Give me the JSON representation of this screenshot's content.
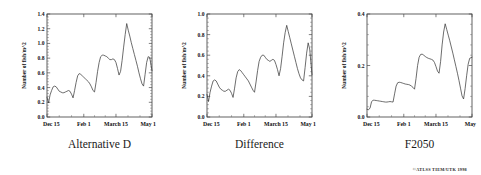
{
  "figure": {
    "credit": "©ATLSS TIEM/UTK 1998",
    "width": 481,
    "height": 175
  },
  "chart_data": [
    {
      "type": "line",
      "title": "Alternative D",
      "xlabel": "",
      "ylabel": "Number of fish/m^2",
      "ylim": [
        0.0,
        1.4
      ],
      "yticks": [
        0.0,
        0.2,
        0.4,
        0.6,
        0.8,
        1.0,
        1.2,
        1.4
      ],
      "ytick_labels": [
        "0.0",
        "0.2",
        "0.4",
        "0.6",
        "0.8",
        "1.0",
        "1.2",
        "1.4"
      ],
      "xlim": [
        0,
        137
      ],
      "xticks": [
        0,
        48,
        90,
        137
      ],
      "xtick_labels": [
        "Dec 15",
        "Feb 1",
        "March 15",
        "May 1"
      ],
      "grid": false,
      "legend": "none",
      "x": [
        0,
        2,
        4,
        6,
        8,
        10,
        12,
        14,
        16,
        18,
        20,
        22,
        24,
        26,
        28,
        30,
        32,
        34,
        36,
        38,
        40,
        42,
        44,
        46,
        48,
        50,
        52,
        54,
        56,
        58,
        60,
        62,
        64,
        66,
        68,
        70,
        72,
        74,
        76,
        78,
        80,
        82,
        84,
        86,
        88,
        90,
        92,
        94,
        96,
        98,
        100,
        102,
        104,
        106,
        108,
        110,
        112,
        114,
        116,
        118,
        120,
        122,
        124,
        126,
        128,
        130,
        132,
        134,
        137
      ],
      "values": [
        0.27,
        0.19,
        0.3,
        0.36,
        0.41,
        0.42,
        0.41,
        0.38,
        0.35,
        0.34,
        0.33,
        0.33,
        0.34,
        0.35,
        0.36,
        0.35,
        0.31,
        0.26,
        0.36,
        0.47,
        0.56,
        0.59,
        0.58,
        0.56,
        0.54,
        0.52,
        0.5,
        0.48,
        0.45,
        0.41,
        0.36,
        0.34,
        0.47,
        0.62,
        0.74,
        0.82,
        0.84,
        0.84,
        0.83,
        0.82,
        0.8,
        0.78,
        0.78,
        0.79,
        0.78,
        0.74,
        0.66,
        0.57,
        0.62,
        0.77,
        0.95,
        1.12,
        1.27,
        1.18,
        1.1,
        1.01,
        0.93,
        0.85,
        0.77,
        0.69,
        0.6,
        0.52,
        0.45,
        0.42,
        0.58,
        0.74,
        0.82,
        0.81,
        0.63
      ]
    },
    {
      "type": "line",
      "title": "Difference",
      "xlabel": "",
      "ylabel": "Number of fish/m^2",
      "ylim": [
        0.0,
        1.0
      ],
      "yticks": [
        0.0,
        0.2,
        0.4,
        0.6,
        0.8,
        1.0
      ],
      "ytick_labels": [
        "0.0",
        "0.2",
        "0.4",
        "0.6",
        "0.8",
        "1.0"
      ],
      "xlim": [
        0,
        137
      ],
      "xticks": [
        0,
        48,
        90,
        137
      ],
      "xtick_labels": [
        "Dec 15",
        "Feb 1",
        "March 15",
        "May 1"
      ],
      "grid": false,
      "legend": "none",
      "x": [
        0,
        2,
        4,
        6,
        8,
        10,
        12,
        14,
        16,
        18,
        20,
        22,
        24,
        26,
        28,
        30,
        32,
        34,
        36,
        38,
        40,
        42,
        44,
        46,
        48,
        50,
        52,
        54,
        56,
        58,
        60,
        62,
        64,
        66,
        68,
        70,
        72,
        74,
        76,
        78,
        80,
        82,
        84,
        86,
        88,
        90,
        92,
        94,
        96,
        98,
        100,
        102,
        104,
        106,
        108,
        110,
        112,
        114,
        116,
        118,
        120,
        122,
        124,
        126,
        128,
        130,
        132,
        134,
        137
      ],
      "values": [
        0.22,
        0.15,
        0.24,
        0.3,
        0.35,
        0.36,
        0.35,
        0.32,
        0.29,
        0.27,
        0.26,
        0.25,
        0.25,
        0.26,
        0.27,
        0.26,
        0.23,
        0.19,
        0.28,
        0.38,
        0.44,
        0.46,
        0.45,
        0.43,
        0.41,
        0.39,
        0.37,
        0.35,
        0.32,
        0.29,
        0.26,
        0.24,
        0.34,
        0.45,
        0.54,
        0.58,
        0.6,
        0.6,
        0.58,
        0.56,
        0.55,
        0.54,
        0.55,
        0.56,
        0.55,
        0.51,
        0.46,
        0.4,
        0.47,
        0.59,
        0.72,
        0.82,
        0.89,
        0.83,
        0.77,
        0.71,
        0.65,
        0.59,
        0.53,
        0.47,
        0.42,
        0.38,
        0.36,
        0.35,
        0.48,
        0.62,
        0.72,
        0.66,
        0.41
      ]
    },
    {
      "type": "line",
      "title": "F2050",
      "xlabel": "",
      "ylabel": "Number of fish/m^2",
      "ylim": [
        0.0,
        0.4
      ],
      "yticks": [
        0.0,
        0.2,
        0.4
      ],
      "ytick_labels": [
        "0.0",
        "0.2",
        "0.4"
      ],
      "xlim": [
        0,
        137
      ],
      "xticks": [
        0,
        48,
        90,
        137
      ],
      "xtick_labels": [
        "Dec 15",
        "Feb 1",
        "March 15",
        "May"
      ],
      "grid": false,
      "legend": "none",
      "x": [
        0,
        2,
        4,
        6,
        8,
        10,
        12,
        14,
        16,
        18,
        20,
        22,
        24,
        26,
        28,
        30,
        32,
        34,
        36,
        38,
        40,
        42,
        44,
        46,
        48,
        50,
        52,
        54,
        56,
        58,
        60,
        62,
        64,
        66,
        68,
        70,
        72,
        74,
        76,
        78,
        80,
        82,
        84,
        86,
        88,
        90,
        92,
        94,
        96,
        98,
        100,
        102,
        104,
        106,
        108,
        110,
        112,
        114,
        116,
        118,
        120,
        122,
        124,
        126,
        128,
        130,
        132,
        134,
        137
      ],
      "values": [
        0.03,
        0.028,
        0.035,
        0.06,
        0.065,
        0.065,
        0.064,
        0.063,
        0.062,
        0.061,
        0.06,
        0.059,
        0.058,
        0.058,
        0.059,
        0.06,
        0.059,
        0.058,
        0.09,
        0.12,
        0.133,
        0.135,
        0.134,
        0.132,
        0.13,
        0.128,
        0.127,
        0.126,
        0.124,
        0.12,
        0.115,
        0.108,
        0.15,
        0.2,
        0.232,
        0.243,
        0.244,
        0.24,
        0.235,
        0.231,
        0.228,
        0.226,
        0.224,
        0.221,
        0.212,
        0.196,
        0.178,
        0.17,
        0.215,
        0.28,
        0.33,
        0.362,
        0.34,
        0.318,
        0.296,
        0.272,
        0.248,
        0.222,
        0.196,
        0.17,
        0.142,
        0.112,
        0.082,
        0.07,
        0.11,
        0.16,
        0.205,
        0.228,
        0.232
      ]
    }
  ]
}
